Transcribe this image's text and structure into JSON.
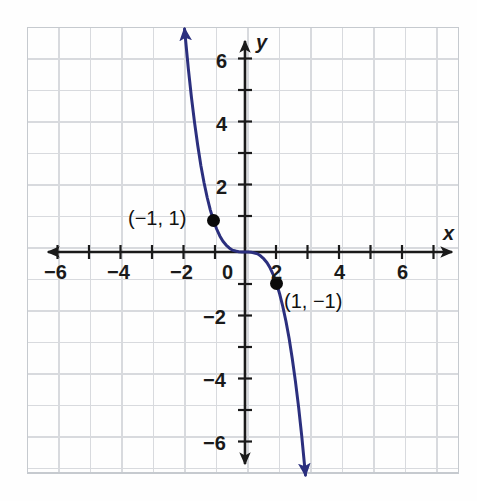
{
  "figure": {
    "kind": "coordinate-grid-graph",
    "background_color": "#fefefe",
    "grid_color": "#d6d9de",
    "grid_border_color": "#c3c7cd",
    "axis_color": "#1a1a1a",
    "curve_color": "#2b2f7e",
    "point_color": "#0a0a0a"
  },
  "axes": {
    "x_name": "x",
    "y_name": "y",
    "origin_label": "0",
    "x_tick_labels": [
      "−6",
      "−4",
      "−2",
      "2",
      "4",
      "6"
    ],
    "y_tick_labels": [
      "6",
      "4",
      "2",
      "−2",
      "−4",
      "−6"
    ]
  },
  "points": [
    {
      "label": "(−1, 1)",
      "x": -1,
      "y": 1
    },
    {
      "label": "(1, −1)",
      "x": 1,
      "y": -1
    }
  ],
  "chart_data": {
    "type": "line",
    "title": "",
    "xlabel": "x",
    "ylabel": "y",
    "xlim": [
      -7,
      7
    ],
    "ylim": [
      -7,
      7
    ],
    "xticks": [
      -6,
      -4,
      -2,
      0,
      2,
      4,
      6
    ],
    "yticks": [
      -6,
      -4,
      -2,
      0,
      2,
      4,
      6
    ],
    "xtick_labels": [
      "−6",
      "−4",
      "−2",
      "0",
      "2",
      "4",
      "6"
    ],
    "ytick_labels": [
      "−6",
      "−4",
      "−2",
      "0",
      "2",
      "4",
      "6"
    ],
    "grid": true,
    "grid_step": 1,
    "legend": null,
    "series": [
      {
        "name": "y = −x³",
        "color": "#2b2f7e",
        "arrow_start": true,
        "arrow_end": true,
        "x": [
          -1.92,
          -1.8,
          -1.7,
          -1.6,
          -1.5,
          -1.4,
          -1.3,
          -1.2,
          -1.1,
          -1.0,
          -0.9,
          -0.8,
          -0.7,
          -0.6,
          -0.5,
          -0.4,
          -0.3,
          -0.2,
          -0.1,
          0.0,
          0.1,
          0.2,
          0.3,
          0.4,
          0.5,
          0.6,
          0.7,
          0.8,
          0.9,
          1.0,
          1.1,
          1.2,
          1.3,
          1.4,
          1.5,
          1.6,
          1.7,
          1.8,
          1.92
        ],
        "y": [
          7.08,
          5.83,
          4.91,
          4.1,
          3.38,
          2.74,
          2.2,
          1.73,
          1.33,
          1.0,
          0.73,
          0.51,
          0.34,
          0.22,
          0.13,
          0.06,
          0.03,
          0.01,
          0.0,
          0.0,
          0.0,
          -0.01,
          -0.03,
          -0.06,
          -0.13,
          -0.22,
          -0.34,
          -0.51,
          -0.73,
          -1.0,
          -1.33,
          -1.73,
          -2.2,
          -2.74,
          -3.38,
          -4.1,
          -4.91,
          -5.83,
          -7.08
        ]
      }
    ],
    "annotations": [
      {
        "text": "(−1, 1)",
        "x": -1,
        "y": 1
      },
      {
        "text": "(1, −1)",
        "x": 1,
        "y": -1
      }
    ]
  },
  "labels": {
    "x_ticks": [
      {
        "text": "−6",
        "left": 44,
        "top": 262
      },
      {
        "text": "−4",
        "left": 107,
        "top": 262
      },
      {
        "text": "−2",
        "left": 170,
        "top": 262
      },
      {
        "text": "2",
        "left": 270,
        "top": 262
      },
      {
        "text": "4",
        "left": 332,
        "top": 262
      },
      {
        "text": "6",
        "left": 395,
        "top": 262
      }
    ],
    "y_ticks": [
      {
        "text": "6",
        "left": 215,
        "top": 51
      },
      {
        "text": "4",
        "left": 215,
        "top": 114
      },
      {
        "text": "2",
        "left": 215,
        "top": 177
      },
      {
        "text": "−2",
        "left": 203,
        "top": 307
      },
      {
        "text": "−4",
        "left": 203,
        "top": 370
      },
      {
        "text": "−6",
        "left": 203,
        "top": 433
      }
    ],
    "origin": {
      "text": "0",
      "left": 221,
      "top": 262
    },
    "x_name": {
      "text": "x",
      "left": 442,
      "top": 224
    },
    "y_name": {
      "text": "y",
      "left": 255,
      "top": 33
    },
    "point_labels": [
      {
        "text": "(−1, 1)",
        "left": 128,
        "top": 207
      },
      {
        "text": "(1, −1)",
        "left": 283,
        "top": 290
      }
    ]
  }
}
